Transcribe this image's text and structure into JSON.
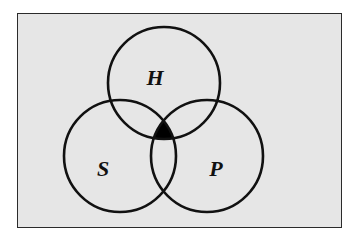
{
  "diagram": {
    "type": "venn",
    "sets": [
      {
        "id": "H",
        "label": "H"
      },
      {
        "id": "S",
        "label": "S"
      },
      {
        "id": "P",
        "label": "P"
      }
    ],
    "shaded_regions": [
      {
        "sets": [
          "H",
          "S",
          "P"
        ],
        "description": "triple intersection H ∩ S ∩ P",
        "fill": "#000000"
      }
    ],
    "colors": {
      "background": "#e6e6e6",
      "outline": "#111111",
      "border": "#2b2b2b"
    }
  }
}
